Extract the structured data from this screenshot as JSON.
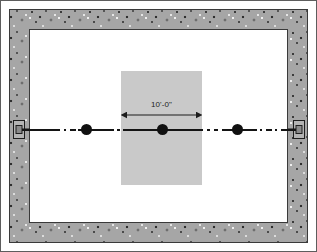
{
  "figure": {
    "name": "partition-wall-framing-plan",
    "width": 317,
    "height": 252,
    "background_color": "#ffffff",
    "outer_frame_color": "#5d5d5d"
  },
  "room": {
    "wall": {
      "label": "concrete-masonry-perimeter-wall",
      "fill_color": "#a6a6a6",
      "line_color": "#3a3a3a",
      "thickness_px": 20,
      "texture": "speckled-aggregate"
    },
    "floor": {
      "label": "interior-floor-area",
      "fill_color": "#ffffff"
    }
  },
  "slab": {
    "label": "shaded-opening-area",
    "fill_color": "#c9c9c9"
  },
  "centerline": {
    "label": "beam-centerline",
    "line_color": "#141414",
    "pattern": "dash-dot",
    "segments": [
      {
        "name": "left-solid",
        "style": "solid"
      },
      {
        "name": "left-dash",
        "style": "dash-dot"
      },
      {
        "name": "mid-solid",
        "style": "solid"
      },
      {
        "name": "mid-dash",
        "style": "dash-dot"
      },
      {
        "name": "slab-solid",
        "style": "solid"
      },
      {
        "name": "right-dash",
        "style": "dash-dot"
      },
      {
        "name": "right-solid",
        "style": "solid"
      },
      {
        "name": "far-dash",
        "style": "dash-dot"
      },
      {
        "name": "far-solid",
        "style": "solid"
      }
    ]
  },
  "nodes": [
    {
      "name": "column-node-left",
      "label": "",
      "color": "#111111"
    },
    {
      "name": "column-node-center",
      "label": "",
      "color": "#111111"
    },
    {
      "name": "column-node-right",
      "label": "",
      "color": "#111111"
    }
  ],
  "bearings": [
    {
      "name": "wall-bearing-anchor-left",
      "label": ""
    },
    {
      "name": "wall-bearing-anchor-right",
      "label": ""
    }
  ],
  "dimension": {
    "text": "10'-0\"",
    "value_feet": 10,
    "value_inches": 0,
    "arrow_color": "#1c1c1c",
    "style": "double-headed-arrow"
  }
}
